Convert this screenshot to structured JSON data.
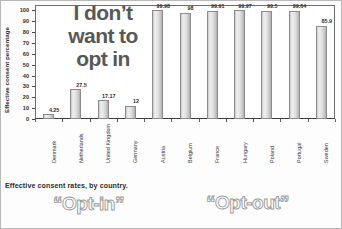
{
  "chart_data": {
    "type": "bar",
    "title": "",
    "xlabel": "",
    "ylabel": "Effective consent percentage",
    "ylim": [
      0,
      105
    ],
    "yticks": [
      0,
      10,
      20,
      30,
      40,
      50,
      60,
      70,
      80,
      90,
      100
    ],
    "grid": false,
    "legend": "none",
    "categories": [
      "Denmark",
      "Netherlands",
      "United Kingdom",
      "Germany",
      "Austria",
      "Belgium",
      "France",
      "Hungary",
      "Poland",
      "Portugal",
      "Sweden"
    ],
    "values": [
      4.25,
      27.5,
      17.17,
      12,
      99.98,
      98,
      99.91,
      99.97,
      99.5,
      99.64,
      85.9
    ],
    "value_labels": [
      "4.25",
      "27.5",
      "17.17",
      "12",
      "99.98",
      "98",
      "99.91",
      "99.97",
      "99.5",
      "99.64",
      "85.9"
    ],
    "groups": [
      {
        "name": "“Opt-in”",
        "categories": [
          "Denmark",
          "Netherlands",
          "United Kingdom",
          "Germany"
        ]
      },
      {
        "name": "“Opt-out”",
        "categories": [
          "Austria",
          "Belgium",
          "France",
          "Hungary",
          "Poland",
          "Portugal",
          "Sweden"
        ]
      }
    ],
    "annotations": [
      "I don’t want to opt in"
    ],
    "caption": "Effective consent rates, by country."
  },
  "axis": {
    "y_label": "Effective consent percentage",
    "y_ticks": [
      "100",
      "90",
      "80",
      "70",
      "60",
      "50",
      "40",
      "30",
      "20",
      "10",
      "0"
    ]
  },
  "bars": [
    {
      "country": "Denmark",
      "value": 4.25,
      "label": "4.25"
    },
    {
      "country": "Netherlands",
      "value": 27.5,
      "label": "27.5"
    },
    {
      "country": "United Kingdom",
      "value": 17.17,
      "label": "17.17"
    },
    {
      "country": "Germany",
      "value": 12,
      "label": "12"
    },
    {
      "country": "Austria",
      "value": 99.98,
      "label": "99.98"
    },
    {
      "country": "Belgium",
      "value": 98,
      "label": "98"
    },
    {
      "country": "France",
      "value": 99.91,
      "label": "99.91"
    },
    {
      "country": "Hungary",
      "value": 99.97,
      "label": "99.97"
    },
    {
      "country": "Poland",
      "value": 99.5,
      "label": "99.5"
    },
    {
      "country": "Portugal",
      "value": 99.64,
      "label": "99.64"
    },
    {
      "country": "Sweden",
      "value": 85.9,
      "label": "85.9"
    }
  ],
  "overlay": {
    "line1": "I don’t",
    "line2": "want to",
    "line3": "opt in"
  },
  "caption": {
    "text": "Effective consent rates, by country."
  },
  "groups": {
    "opt_in": "“Opt-in”",
    "opt_out": "“Opt-out”"
  },
  "colors": {
    "bar_fill": "#e2e2e2",
    "bar_edge": "#8c8c8c",
    "overlay_text": "#585858",
    "outline_text": "#9a9a9a",
    "axis": "#4a4a4a"
  }
}
